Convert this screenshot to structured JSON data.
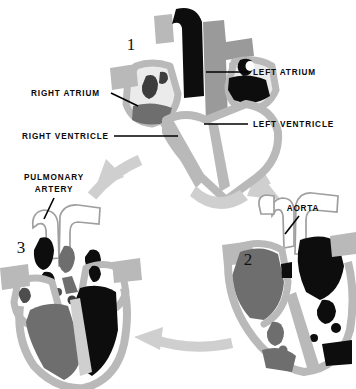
{
  "figure": {
    "type": "anatomical-diagram",
    "background_color": "#ffffff"
  },
  "palette": {
    "myocardium_wall": "#b9b9b9",
    "deoxygenated_blood": "#6e6e6e",
    "oxygenated_blood": "#0d0d0d",
    "chamber_empty": "#ffffff",
    "vessel_outline": "#8f8f8f",
    "cycle_arrow": "#cfcfcf",
    "label_text": "#0a0a0a",
    "leader_line": "#000000"
  },
  "phases": [
    {
      "id": "phase-1",
      "numeral": "1",
      "x": 131,
      "y": 50
    },
    {
      "id": "phase-2",
      "numeral": "2",
      "x": 248,
      "y": 265
    },
    {
      "id": "phase-3",
      "numeral": "3",
      "x": 21,
      "y": 253
    }
  ],
  "labels": [
    {
      "id": "left-atrium",
      "text": "LEFT ATRIUM",
      "x": 253,
      "y": 75,
      "anchor": "start",
      "leader": {
        "x1": 248,
        "y1": 72,
        "x2": 206,
        "y2": 72
      }
    },
    {
      "id": "right-atrium",
      "text": "RIGHT ATRIUM",
      "x": 31,
      "y": 96,
      "anchor": "start",
      "leader": {
        "x1": 111,
        "y1": 93,
        "x2": 138,
        "y2": 106
      }
    },
    {
      "id": "left-ventricle",
      "text": "LEFT VENTRICLE",
      "x": 253,
      "y": 127,
      "anchor": "start",
      "leader": {
        "x1": 248,
        "y1": 124,
        "x2": 204,
        "y2": 124
      }
    },
    {
      "id": "right-ventricle",
      "text": "RIGHT VENTRICLE",
      "x": 22,
      "y": 139,
      "anchor": "start",
      "leader": {
        "x1": 114,
        "y1": 136,
        "x2": 178,
        "y2": 136
      }
    },
    {
      "id": "pulmonary-artery",
      "text": "PULMONARY",
      "text_line2": "ARTERY",
      "x": 54,
      "y": 180,
      "anchor": "middle",
      "leader": {
        "x1": 54,
        "y1": 198,
        "x2": 44,
        "y2": 219
      }
    },
    {
      "id": "aorta",
      "text": "AORTA",
      "x": 303,
      "y": 211,
      "anchor": "middle",
      "leader": {
        "x1": 299,
        "y1": 216,
        "x2": 285,
        "y2": 234
      }
    }
  ],
  "cycle_arrows": [
    {
      "id": "arrow-1-to-2",
      "from": "phase-1",
      "to": "phase-2",
      "direction": "down-right"
    },
    {
      "id": "arrow-2-to-3",
      "from": "phase-2",
      "to": "phase-3",
      "direction": "left"
    },
    {
      "id": "arrow-3-to-1",
      "from": "phase-3",
      "to": "phase-1",
      "direction": "up-right"
    }
  ]
}
